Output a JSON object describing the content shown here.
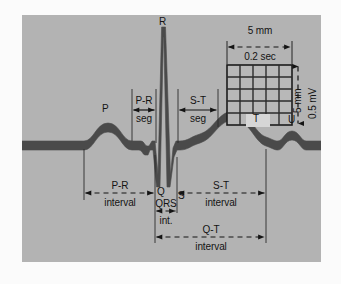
{
  "figure": {
    "colors": {
      "panel_background": "#b3b3b3",
      "page_background": "#fbfbfb",
      "trace": "#4a4a4a",
      "text": "#141414",
      "grid_line": "#333333",
      "grid_fill": "#b8b8b8"
    },
    "wave_labels": {
      "p": "P",
      "q": "Q",
      "r": "R",
      "s": "S",
      "t": "T",
      "u": "U"
    },
    "segments": [
      {
        "id": "pr-seg",
        "name": "P-R",
        "sub": "seg"
      },
      {
        "id": "st-seg",
        "name": "S-T",
        "sub": "seg"
      }
    ],
    "intervals": [
      {
        "id": "pr-interval",
        "name": "P-R",
        "sub": "interval"
      },
      {
        "id": "qrs-interval",
        "name": "QRS",
        "sub": "int."
      },
      {
        "id": "st-interval",
        "name": "S-T",
        "sub": "interval"
      },
      {
        "id": "qt-interval",
        "name": "Q-T",
        "sub": "interval"
      }
    ],
    "calibration_grid": {
      "horizontal_mm": "5 mm",
      "horizontal_time": "0.2 sec",
      "vertical_mm": "5 mm",
      "vertical_voltage": "0.5 mV",
      "cells_x": 5,
      "cells_y": 5,
      "inner_label": "T"
    }
  }
}
